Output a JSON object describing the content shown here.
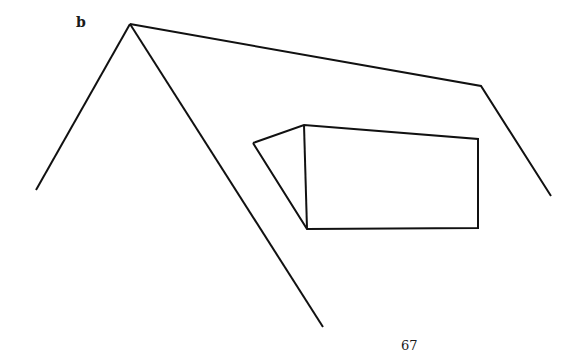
{
  "figure": {
    "label": "b",
    "stroke_color": "#111111",
    "background_color": "#ffffff",
    "shapes": [
      {
        "name": "left-roof-line",
        "points": [
          [
            130,
            24
          ],
          [
            36,
            190
          ]
        ]
      },
      {
        "name": "right-long-line",
        "points": [
          [
            130,
            24
          ],
          [
            323,
            327
          ]
        ]
      },
      {
        "name": "top-line",
        "points": [
          [
            130,
            24
          ],
          [
            481,
            86
          ],
          [
            551,
            196
          ]
        ]
      },
      {
        "name": "box-outline",
        "points": [
          [
            253,
            143
          ],
          [
            304,
            125
          ],
          [
            478,
            139
          ],
          [
            478,
            228
          ],
          [
            307,
            229
          ],
          [
            253,
            143
          ]
        ]
      },
      {
        "name": "box-front-edge",
        "points": [
          [
            304,
            125
          ],
          [
            307,
            229
          ]
        ]
      }
    ]
  },
  "page": {
    "number": "67"
  }
}
